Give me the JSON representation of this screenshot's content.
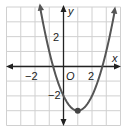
{
  "chart_data": {
    "type": "line",
    "title": "",
    "function": "y = x^2 - 2x - 2",
    "xlabel": "x",
    "ylabel": "y",
    "origin_label": "O",
    "xlim": [
      -4,
      4
    ],
    "ylim": [
      -4,
      4
    ],
    "grid": true,
    "x_tick_labels": [
      {
        "value": -2,
        "label": "−2"
      },
      {
        "value": 2,
        "label": "2"
      }
    ],
    "y_tick_labels": [
      {
        "value": 2,
        "label": "2"
      },
      {
        "value": -2,
        "label": "−2"
      }
    ],
    "vertex": {
      "x": 1,
      "y": -3
    },
    "y_intercept": -2,
    "x_intercepts": [
      -0.73,
      2.73
    ],
    "series": [
      {
        "name": "parabola",
        "x": [
          -1.45,
          -1,
          -0.73,
          0,
          0.5,
          1,
          1.5,
          2,
          2.73,
          3,
          3.6
        ],
        "y": [
          3.0,
          1,
          0,
          -2,
          -2.75,
          -3,
          -2.75,
          -2,
          0,
          1,
          3.56
        ]
      }
    ],
    "colors": {
      "curve": "#555555",
      "axis": "#222222",
      "grid": "#d0d0d0",
      "vertex": "#444444"
    }
  }
}
